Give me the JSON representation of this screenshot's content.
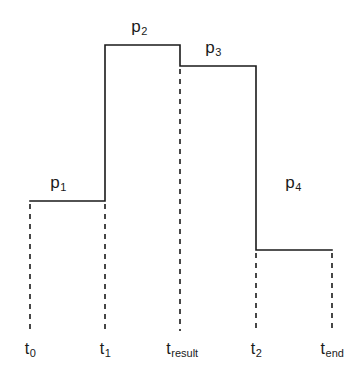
{
  "figure": {
    "kind": "step-function-diagram",
    "background_color": "#ffffff",
    "line_color": "#1a1a1a",
    "line_width": 1.6,
    "dash_color": "#1a1a1a",
    "dash_pattern": "5 5"
  },
  "chart_data": {
    "type": "line",
    "title": "",
    "xlabel": "",
    "ylabel": "",
    "style": "step-post",
    "grid": false,
    "legend": null,
    "axis_ranges": {
      "xlim": [
        0,
        5
      ],
      "ylim": [
        0,
        4
      ]
    },
    "x_tick_labels": [
      "t_0",
      "t_1",
      "t_result",
      "t_2",
      "t_end"
    ],
    "x_tick_label_html": [
      "t<sub>0</sub>",
      "t<sub>1</sub>",
      "t<sub>result</sub>",
      "t<sub>2</sub>",
      "t<sub>end</sub>"
    ],
    "x_tick_pixels": [
      30,
      105,
      180,
      256,
      332
    ],
    "segment_labels": [
      "p_1",
      "p_2",
      "p_3",
      "p_4"
    ],
    "segment_label_html": [
      "p<sub>1</sub>",
      "p<sub>2</sub>",
      "p<sub>3</sub>",
      "p<sub>4</sub>"
    ],
    "segments": [
      {
        "label": "p_1",
        "x_start": "t_0",
        "x_end": "t_1",
        "level_px": 201
      },
      {
        "label": "p_2",
        "x_start": "t_1",
        "x_end": "t_result",
        "level_px": 45
      },
      {
        "label": "p_3",
        "x_start": "t_result",
        "x_end": "t_2",
        "level_px": 66
      },
      {
        "label": "p_4",
        "x_start": "t_2",
        "x_end": "t_end",
        "level_px": 250
      }
    ],
    "values": [
      1,
      3.2,
      3.05,
      0.65
    ],
    "categories": [
      "p_1",
      "p_2",
      "p_3",
      "p_4"
    ]
  },
  "price_labels": [
    {
      "name": "p1",
      "html": "p<sub>1</sub>",
      "x": 58,
      "y": 173
    },
    {
      "name": "p2",
      "html": "p<sub>2</sub>",
      "x": 139,
      "y": 17
    },
    {
      "name": "p3",
      "html": "p<sub>3</sub>",
      "x": 213,
      "y": 38
    },
    {
      "name": "p4",
      "html": "p<sub>4</sub>",
      "x": 293,
      "y": 173
    }
  ],
  "time_labels": [
    {
      "name": "t0",
      "html": "t<sub>0</sub>",
      "x": 30,
      "y": 340
    },
    {
      "name": "t1",
      "html": "t<sub>1</sub>",
      "x": 105,
      "y": 340
    },
    {
      "name": "tresult",
      "html": "t<sub>result</sub>",
      "x": 182,
      "y": 340
    },
    {
      "name": "t2",
      "html": "t<sub>2</sub>",
      "x": 256,
      "y": 340
    },
    {
      "name": "tend",
      "html": "t<sub>end</sub>",
      "x": 332,
      "y": 340
    }
  ],
  "step_path": "M 30 201 L 105 201 L 105 45 L 180 45 L 180 66 L 256 66 L 256 250 L 332 250",
  "dashed_drops": [
    {
      "name": "t0",
      "x": 30,
      "y_top": 204,
      "y_bottom": 331
    },
    {
      "name": "t1",
      "x": 105,
      "y_top": 204,
      "y_bottom": 331
    },
    {
      "name": "tresult",
      "x": 180,
      "y_top": 69,
      "y_bottom": 331
    },
    {
      "name": "t2",
      "x": 256,
      "y_top": 253,
      "y_bottom": 331
    },
    {
      "name": "tend",
      "x": 332,
      "y_top": 253,
      "y_bottom": 331
    }
  ]
}
